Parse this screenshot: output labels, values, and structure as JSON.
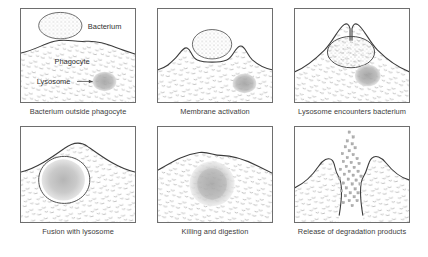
{
  "figure": {
    "colors": {
      "membrane": "#3b3b3b",
      "frame_border": "#6e6e6e",
      "cytoplasm_stipple": "#b9b9b9",
      "bacterium_stipple": "#9a9a9a",
      "lysosome_fill": "#a8a8a8",
      "caption_text": "#3c3c3c",
      "background": "#ffffff"
    },
    "panels": [
      {
        "index": 1,
        "caption": "Bacterium outside phagocyte",
        "labels": [
          {
            "name": "bacterium",
            "text": "Bacterium"
          },
          {
            "name": "phagocyte",
            "text": "Phagocyte"
          },
          {
            "name": "lysosome",
            "text": "Lysosome"
          }
        ],
        "features": [
          "free oval bacterium above cell",
          "phagocyte cytoplasm with stippled texture",
          "lysosome granule with leader arrow"
        ]
      },
      {
        "index": 2,
        "caption": "Membrane activation",
        "labels": [],
        "features": [
          "membrane pseudopods rising either side of bacterium",
          "bacterium resting on cell surface",
          "lysosome granule inside cytoplasm"
        ]
      },
      {
        "index": 3,
        "caption": "Lysosome encounters bacterium",
        "labels": [],
        "features": [
          "bacterium engulfed in phagosome",
          "membrane neck closing above phagosome",
          "lysosome granule approaching phagosome"
        ]
      },
      {
        "index": 4,
        "caption": "Fusion with lysosome",
        "labels": [],
        "features": [
          "phagolysosome formed inside cell",
          "membrane surface smooth and closed",
          "fused granular contents"
        ]
      },
      {
        "index": 5,
        "caption": "Killing and digestion",
        "labels": [],
        "features": [
          "diffuse digested mass, vesicle outline gone",
          "smooth wavy cell surface"
        ]
      },
      {
        "index": 6,
        "caption": "Release of degradation products",
        "labels": [],
        "features": [
          "membrane opens to exterior",
          "stream of small degradation particles expelled upward"
        ]
      }
    ]
  }
}
